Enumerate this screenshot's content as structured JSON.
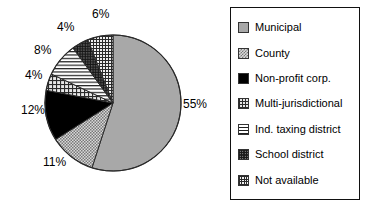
{
  "chart_data": {
    "type": "pie",
    "title": "",
    "labels": [
      "Municipal",
      "County",
      "Non-profit corp.",
      "Multi-jurisdictional",
      "Ind. taxing district",
      "School district",
      "Not available"
    ],
    "values": [
      55,
      11,
      12,
      4,
      8,
      4,
      6
    ],
    "value_labels": [
      "55%",
      "11%",
      "12%",
      "4%",
      "8%",
      "4%",
      "6%"
    ],
    "units": "percent",
    "legend_position": "right",
    "grid": false,
    "start_angle_deg": 0,
    "direction": "clockwise",
    "patterns": [
      "solid-light-gray",
      "fine-checkerboard",
      "solid-black",
      "crosshatch-grid",
      "horizontal-lines",
      "dark-dense-dots",
      "fine-grid"
    ]
  },
  "pie": {
    "slices": [
      {
        "label": "Municipal",
        "pct": 55,
        "text": "55%",
        "pattern": "pat-solid-gray",
        "fill": "url(#fill-solid-gray)"
      },
      {
        "label": "County",
        "pct": 11,
        "text": "11%",
        "pattern": "pat-check-light",
        "fill": "url(#fill-check-light)"
      },
      {
        "label": "Non-profit corp.",
        "pct": 12,
        "text": "12%",
        "pattern": "pat-solid-black",
        "fill": "url(#fill-solid-black)"
      },
      {
        "label": "Multi-jurisdictional",
        "pct": 4,
        "text": "4%",
        "pattern": "pat-grid",
        "fill": "url(#fill-grid)"
      },
      {
        "label": "Ind. taxing district",
        "pct": 8,
        "text": "8%",
        "pattern": "pat-hlines",
        "fill": "url(#fill-hlines)"
      },
      {
        "label": "School district",
        "pct": 4,
        "text": "4%",
        "pattern": "pat-dark-dots",
        "fill": "url(#fill-dark-dots)"
      },
      {
        "label": "Not available",
        "pct": 6,
        "text": "6%",
        "pattern": "pat-fine-grid",
        "fill": "url(#fill-fine-grid)"
      }
    ],
    "center_x": 113,
    "center_y": 103,
    "radius": 68
  },
  "labels": {
    "l0": {
      "text": "55%",
      "x": 183,
      "y": 97
    },
    "l1": {
      "text": "11%",
      "x": 43,
      "y": 155
    },
    "l2": {
      "text": "12%",
      "x": 21,
      "y": 103
    },
    "l3": {
      "text": "4%",
      "x": 25,
      "y": 68
    },
    "l4": {
      "text": "8%",
      "x": 34,
      "y": 43
    },
    "l5": {
      "text": "4%",
      "x": 57,
      "y": 20
    },
    "l6": {
      "text": "6%",
      "x": 92,
      "y": 7
    }
  },
  "legend": {
    "items": [
      {
        "label": "Municipal",
        "swatch": "pat-solid-gray"
      },
      {
        "label": "County",
        "swatch": "pat-check-light"
      },
      {
        "label": "Non-profit corp.",
        "swatch": "pat-solid-black"
      },
      {
        "label": "Multi-jurisdictional",
        "swatch": "pat-grid"
      },
      {
        "label": "Ind. taxing district",
        "swatch": "pat-hlines"
      },
      {
        "label": "School district",
        "swatch": "pat-dark-dots"
      },
      {
        "label": "Not available",
        "swatch": "pat-fine-grid"
      }
    ]
  },
  "colors": {
    "background": "#ffffff",
    "outline": "#111111",
    "text": "#000000",
    "gray_fill": "#a8a8a8",
    "black_fill": "#000000"
  }
}
